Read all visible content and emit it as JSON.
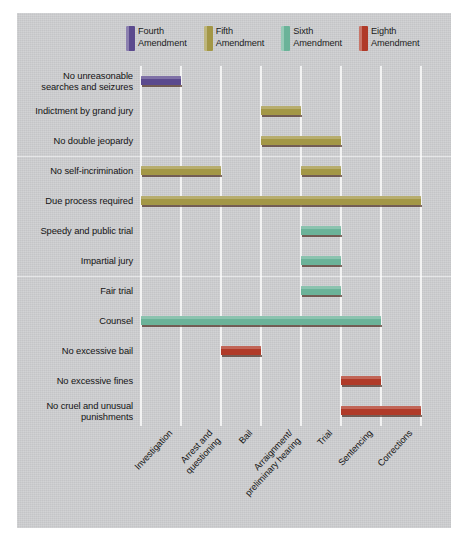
{
  "chart_data": {
    "type": "bar",
    "subtype": "gantt-range",
    "title": "",
    "xlabel": "",
    "ylabel": "",
    "grid": true,
    "legend_position": "top-center",
    "categories": [
      "Investigation",
      "Arrest and\nquestioning",
      "Bail",
      "Arraignment/\npreliminary hearing",
      "Trial",
      "Sentencing",
      "Corrections"
    ],
    "series": [
      {
        "name": "Fourth\nAmendment",
        "color": "#5b4a8e"
      },
      {
        "name": "Fifth\nAmendment",
        "color": "#a39746"
      },
      {
        "name": "Sixth\nAmendment",
        "color": "#6bb399"
      },
      {
        "name": "Eighth\nAmendment",
        "color": "#b03a28"
      }
    ],
    "rows": [
      {
        "label": "No unreasonable\nsearches and seizures",
        "series": "Fourth Amendment",
        "color": "#5b4a8e",
        "spans": [
          {
            "start": 0,
            "end": 1,
            "stages": "Investigation"
          }
        ]
      },
      {
        "label": "Indictment by grand jury",
        "series": "Fifth Amendment",
        "color": "#a39746",
        "spans": [
          {
            "start": 3,
            "end": 4,
            "stages": "Arraignment/preliminary hearing"
          }
        ]
      },
      {
        "label": "No double jeopardy",
        "series": "Fifth Amendment",
        "color": "#a39746",
        "spans": [
          {
            "start": 3,
            "end": 5,
            "stages": "Arraignment/preliminary hearing through Trial"
          }
        ]
      },
      {
        "label": "No self-incrimination",
        "series": "Fifth Amendment",
        "color": "#a39746",
        "spans": [
          {
            "start": 0,
            "end": 2,
            "stages": "Investigation through Arrest and questioning"
          },
          {
            "start": 4,
            "end": 5,
            "stages": "Trial"
          }
        ]
      },
      {
        "label": "Due process required",
        "series": "Fifth Amendment",
        "color": "#a39746",
        "spans": [
          {
            "start": 0,
            "end": 7,
            "stages": "Investigation through Corrections"
          }
        ]
      },
      {
        "label": "Speedy and public trial",
        "series": "Sixth Amendment",
        "color": "#6bb399",
        "spans": [
          {
            "start": 4,
            "end": 5,
            "stages": "Trial"
          }
        ]
      },
      {
        "label": "Impartial jury",
        "series": "Sixth Amendment",
        "color": "#6bb399",
        "spans": [
          {
            "start": 4,
            "end": 5,
            "stages": "Trial"
          }
        ]
      },
      {
        "label": "Fair trial",
        "series": "Sixth Amendment",
        "color": "#6bb399",
        "spans": [
          {
            "start": 4,
            "end": 5,
            "stages": "Trial"
          }
        ]
      },
      {
        "label": "Counsel",
        "series": "Sixth Amendment",
        "color": "#6bb399",
        "spans": [
          {
            "start": 0,
            "end": 6,
            "stages": "Investigation through Sentencing"
          }
        ]
      },
      {
        "label": "No excessive bail",
        "series": "Eighth Amendment",
        "color": "#b03a28",
        "spans": [
          {
            "start": 2,
            "end": 3,
            "stages": "Bail"
          }
        ]
      },
      {
        "label": "No excessive fines",
        "series": "Eighth Amendment",
        "color": "#b03a28",
        "spans": [
          {
            "start": 5,
            "end": 6,
            "stages": "Sentencing"
          }
        ]
      },
      {
        "label": "No cruel and unusual\npunishments",
        "series": "Eighth Amendment",
        "color": "#b03a28",
        "spans": [
          {
            "start": 5,
            "end": 7,
            "stages": "Sentencing through Corrections"
          }
        ]
      }
    ]
  },
  "legend": {
    "items": [
      {
        "label": "Fourth\nAmendment",
        "color": "#5b4a8e"
      },
      {
        "label": "Fifth\nAmendment",
        "color": "#a39746"
      },
      {
        "label": "Sixth\nAmendment",
        "color": "#6bb399"
      },
      {
        "label": "Eighth\nAmendment",
        "color": "#b03a28"
      }
    ]
  },
  "xaxis": {
    "ticks": [
      "Investigation",
      "Arrest and\nquestioning",
      "Bail",
      "Arraignment/\npreliminary hearing",
      "Trial",
      "Sentencing",
      "Corrections"
    ]
  },
  "colors": {
    "panel": "#cfd0d2",
    "gridline": "#f2f2f2",
    "text": "#141414",
    "background": "#ffffff"
  }
}
